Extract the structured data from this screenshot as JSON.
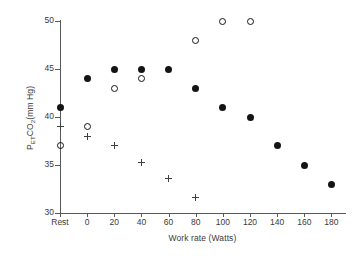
{
  "chart_data": {
    "type": "scatter",
    "title": "",
    "xlabel": "Work rate (Watts)",
    "ylabel": "PETCO2 (mm Hg)",
    "ylabel_parts": {
      "base1": "P",
      "sub1": "ET",
      "base2": "CO",
      "sub2": "2",
      "tail": "(mm Hg)"
    },
    "xlim": [
      -20,
      190
    ],
    "ylim": [
      30,
      50
    ],
    "grid": false,
    "legend": "none",
    "x_tick_labels": [
      "Rest",
      "0",
      "20",
      "40",
      "60",
      "80",
      "100",
      "120",
      "140",
      "160",
      "180"
    ],
    "x_tick_values": [
      -20,
      0,
      20,
      40,
      60,
      80,
      100,
      120,
      140,
      160,
      180
    ],
    "y_tick_labels": [
      "30",
      "35",
      "40",
      "45",
      "50"
    ],
    "y_tick_values": [
      30,
      35,
      40,
      45,
      50
    ],
    "series": [
      {
        "name": "filled-circle",
        "marker": "filled-circle",
        "color": "#141414",
        "x": [
          -20,
          0,
          20,
          40,
          60,
          80,
          100,
          120,
          140,
          160,
          180
        ],
        "y": [
          41,
          44,
          45,
          45,
          45,
          43,
          41,
          40,
          37,
          35,
          33
        ]
      },
      {
        "name": "open-circle",
        "marker": "open-circle",
        "color": "#141414",
        "x": [
          -20,
          0,
          20,
          40,
          80,
          100,
          120
        ],
        "y": [
          37,
          39,
          43,
          44,
          48,
          50,
          50
        ]
      },
      {
        "name": "plus",
        "marker": "plus",
        "color": "#3f3f3f",
        "x": [
          -20,
          0,
          20,
          40,
          60,
          80
        ],
        "y": [
          39,
          38,
          37,
          35.3,
          33.6,
          31.6
        ]
      }
    ]
  }
}
